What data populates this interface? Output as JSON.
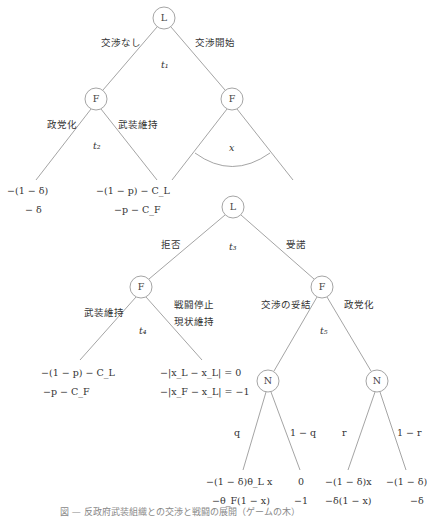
{
  "tree1": {
    "root": {
      "label": "L",
      "time": "t₁"
    },
    "edges": {
      "left": "交渉なし",
      "right": "交渉開始"
    },
    "left_node": {
      "label": "F",
      "time": "t₂",
      "edges": {
        "left": "政党化",
        "right": "武装維持"
      }
    },
    "right_node": {
      "label": "F",
      "arc_label": "x"
    },
    "payoffs": [
      {
        "L": "−(1 − δ)",
        "F": "− δ"
      },
      {
        "L": "−(1 − p) − C_L",
        "F": "−p − C_F"
      }
    ]
  },
  "tree2": {
    "root": {
      "label": "L",
      "time": "t₃"
    },
    "edges": {
      "left": "拒否",
      "right": "受諾"
    },
    "left_node": {
      "label": "F",
      "time": "t₄",
      "edges": {
        "left": "武装維持",
        "right_line1": "戦闘停止",
        "right_line2": "現状維持"
      }
    },
    "right_node": {
      "label": "F",
      "time": "t₅",
      "edges": {
        "left": "交渉の妥結",
        "right": "政党化"
      }
    },
    "nature_left": {
      "label": "N",
      "edges": {
        "left": "q",
        "right": "1 − q"
      }
    },
    "nature_right": {
      "label": "N",
      "edges": {
        "left": "r",
        "right": "1 − r"
      }
    },
    "payoffs": [
      {
        "L": "−(1 − p) − C_L",
        "F": "−p − C_F"
      },
      {
        "L": "−|x_L − x_L| = 0",
        "F": "−|x_F − x_L| = −1"
      },
      {
        "L": "−(1 − δ)θ_L x",
        "F": "−θ_F(1 − x)"
      },
      {
        "L": "0",
        "F": "−1"
      },
      {
        "L": "−(1 − δ)x",
        "F": "−δ(1 − x)"
      },
      {
        "L": "−(1 − δ)",
        "F": "−δ"
      }
    ]
  },
  "caption": "図 — 反政府武装組織との交渉と戦闘の展開（ゲームの木）"
}
